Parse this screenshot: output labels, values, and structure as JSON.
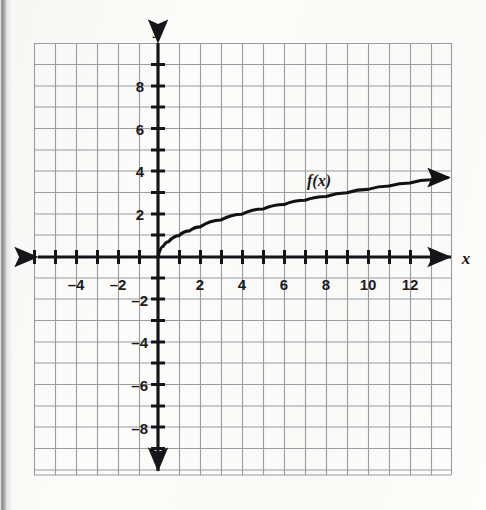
{
  "figure": {
    "kind": "coordinate-plane-graph",
    "background_color": "#fbfbfa",
    "grid_color": "#9a9a9e",
    "axis_color": "#15151a",
    "curve_color": "#121215",
    "x_axis_label": "x",
    "y_axis_label": "y",
    "curve_label": "f(x)"
  },
  "chart_data": {
    "type": "line",
    "title": "",
    "xlabel": "x",
    "ylabel": "y",
    "curve_label": "f(x)",
    "function": "square-root",
    "grid": true,
    "grid_step": 1,
    "legend_position": "inline-above-curve",
    "xlim": [
      -5.9,
      14
    ],
    "ylim": [
      -10.2,
      10.4
    ],
    "x_ticks": [
      -4,
      -2,
      2,
      4,
      6,
      8,
      10,
      12
    ],
    "x_tick_labels": [
      "–4",
      "–2",
      "2",
      "4",
      "6",
      "8",
      "10",
      "12"
    ],
    "y_ticks": [
      8,
      6,
      4,
      2,
      -2,
      -4,
      -6,
      -8
    ],
    "y_tick_labels": [
      "8",
      "6",
      "4",
      "2",
      "–2",
      "–4",
      "–6",
      "–8"
    ],
    "x": [
      0,
      0.25,
      0.5,
      1,
      1.5,
      2,
      3,
      4,
      5,
      6,
      7,
      8,
      9,
      10,
      11,
      12,
      13,
      13.8
    ],
    "y": [
      0,
      0.5,
      0.71,
      1,
      1.22,
      1.41,
      1.73,
      2,
      2.24,
      2.45,
      2.65,
      2.83,
      3,
      3.16,
      3.32,
      3.46,
      3.61,
      3.71
    ],
    "domain_start": [
      0,
      0
    ],
    "arrow_end": [
      13.8,
      3.71
    ],
    "annotations": [
      {
        "text": "f(x)",
        "x": 7.1,
        "y": 3.55
      }
    ]
  },
  "axes": {
    "x_arrow_left": true,
    "x_arrow_right": true,
    "y_arrow_up": true,
    "y_arrow_down": true
  }
}
